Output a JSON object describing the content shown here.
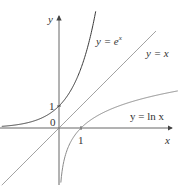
{
  "chart_data": {
    "type": "line",
    "title": "",
    "xlabel": "x",
    "ylabel": "y",
    "xlim": [
      -2.6,
      5.4
    ],
    "ylim": [
      -3.6,
      5.6
    ],
    "grid": false,
    "origin_label": "0",
    "x_ticks": [
      {
        "value": 1,
        "label": "1"
      }
    ],
    "y_ticks": [
      {
        "value": 1,
        "label": "1"
      }
    ],
    "series": [
      {
        "name": "y = e^x",
        "label_text": "y = e",
        "label_sup": "x",
        "color": "#3a3a3a",
        "function": "exp(x)",
        "x_range": [
          -2.6,
          1.8
        ]
      },
      {
        "name": "y = x",
        "label_text": "y = x",
        "color": "#8a8a8a",
        "function": "x",
        "x_range": [
          -2.6,
          4.4
        ]
      },
      {
        "name": "y = ln x",
        "label_text": "y = ln x",
        "color": "#8a8a8a",
        "function": "ln(x)",
        "x_range": [
          0.03,
          5.4
        ]
      }
    ]
  },
  "labels": {
    "x_axis": "x",
    "y_axis": "y",
    "origin": "0",
    "x_tick_1": "1",
    "y_tick_1": "1",
    "exp_label": "y = e",
    "exp_sup": "x",
    "identity_label": "y = x",
    "ln_label": "y = ln x"
  }
}
